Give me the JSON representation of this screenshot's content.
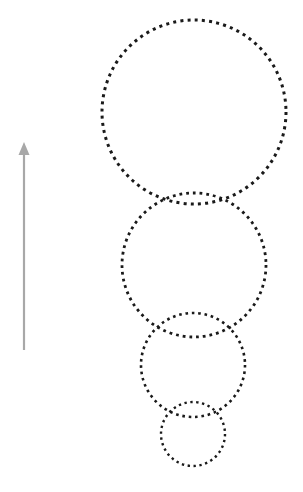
{
  "figure": {
    "background_color": "#ffffff",
    "width": 303,
    "height": 492
  },
  "chart_data": {
    "type": "scatter",
    "title": "",
    "xlabel": "",
    "ylabel": "",
    "xlim": [
      0,
      303
    ],
    "ylim": [
      0,
      492
    ],
    "grid": false,
    "legend": null,
    "annotations": [],
    "series": [
      {
        "name": "circle-1-largest",
        "shape": "circle",
        "style": "dotted",
        "color": "#1a1a1a",
        "cx": 194,
        "cy": 112,
        "r": 92,
        "dot_size": 3.0,
        "dot_gap": 4.2,
        "stroke_width": 3.0
      },
      {
        "name": "circle-2",
        "shape": "circle",
        "style": "dotted",
        "color": "#1a1a1a",
        "cx": 194,
        "cy": 265,
        "r": 72,
        "dot_size": 2.8,
        "dot_gap": 4.0,
        "stroke_width": 2.8
      },
      {
        "name": "circle-3",
        "shape": "circle",
        "style": "dotted",
        "color": "#1a1a1a",
        "cx": 193,
        "cy": 365,
        "r": 52,
        "dot_size": 2.6,
        "dot_gap": 3.8,
        "stroke_width": 2.6
      },
      {
        "name": "circle-4-smallest",
        "shape": "circle",
        "style": "dotted",
        "color": "#1a1a1a",
        "cx": 193,
        "cy": 434,
        "r": 32,
        "dot_size": 2.4,
        "dot_gap": 3.6,
        "stroke_width": 2.4
      }
    ],
    "arrow": {
      "name": "upward-arrow",
      "color": "#a8a8a8",
      "x": 24,
      "y_tail": 350,
      "y_tip": 142,
      "direction": "up",
      "head_width": 11,
      "head_length": 13
    }
  }
}
